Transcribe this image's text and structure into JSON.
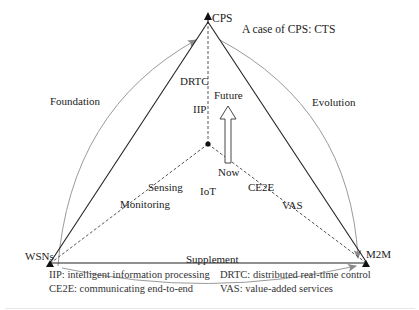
{
  "diagram": {
    "vertices": {
      "top": "CPS",
      "left": "WSNs",
      "right": "M2M"
    },
    "center_label": "IoT",
    "case_note": "A case of CPS: CTS",
    "arcs": {
      "left": "Foundation",
      "right": "Evolution",
      "bottom": "Supplement"
    },
    "spokes": {
      "vertical": [
        "DRTC",
        "IIP"
      ],
      "left": [
        "Sensing",
        "Monitoring"
      ],
      "right": [
        "CE2E",
        "VAS"
      ]
    },
    "transition_arrow": {
      "from": "Now",
      "to": "Future"
    },
    "legend": [
      {
        "abbr": "IIP",
        "text": "IIP: intelligent information processing"
      },
      {
        "abbr": "DRTC",
        "text": "DRTC: distributed real-time control"
      },
      {
        "abbr": "CE2E",
        "text": "CE2E: communicating end-to-end"
      },
      {
        "abbr": "VAS",
        "text": "VAS: value-added services"
      }
    ],
    "colors": {
      "triangle": "#222222",
      "arcs": "#999999",
      "dashed": "#444444"
    }
  }
}
